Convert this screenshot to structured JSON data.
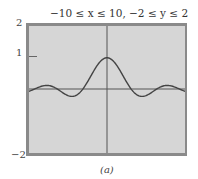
{
  "chart_data": {
    "type": "line",
    "title": "−10 ≤ x ≤ 10, −2 ≤ y ≤ 2",
    "caption": "(a)",
    "xlim": [
      -10,
      10
    ],
    "ylim": [
      -2,
      2
    ],
    "yticks": [
      "2",
      "1",
      "−2"
    ],
    "xlabel": "",
    "ylabel": "",
    "grid": false,
    "series": [
      {
        "name": "y = sin(x)/x",
        "x": [
          -10,
          -9,
          -8,
          -7,
          -6,
          -5,
          -4,
          -3,
          -2,
          -1,
          0,
          1,
          2,
          3,
          4,
          5,
          6,
          7,
          8,
          9,
          10
        ],
        "values": [
          -0.05,
          0.05,
          0.12,
          0.09,
          -0.05,
          -0.19,
          -0.19,
          0.05,
          0.45,
          0.84,
          1.0,
          0.84,
          0.45,
          0.05,
          -0.19,
          -0.19,
          -0.05,
          0.09,
          0.12,
          0.05,
          -0.05
        ]
      }
    ]
  }
}
